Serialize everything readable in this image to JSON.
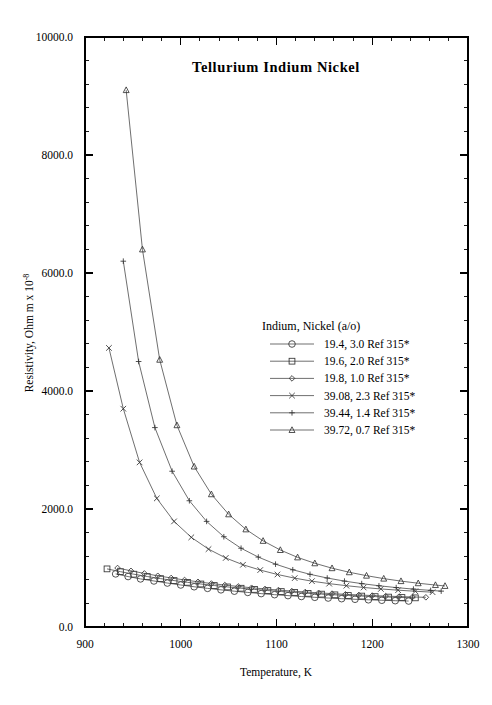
{
  "chart_data": {
    "type": "line",
    "title": "Tellurium  Indium  Nickel",
    "xlabel": "Temperature,  K",
    "ylabel": "Resistivity, Ohm m x 10",
    "ylabel_exponent": "-8",
    "xlim": [
      900,
      1300
    ],
    "ylim": [
      0,
      10000
    ],
    "xticks": [
      900,
      1000,
      1100,
      1200,
      1300
    ],
    "xtick_labels": [
      "900",
      "1000",
      "1100",
      "1200",
      "1300"
    ],
    "yticks": [
      0,
      2000,
      4000,
      6000,
      8000,
      10000
    ],
    "ytick_labels": [
      "0.0",
      "2000.0",
      "4000.0",
      "6000.0",
      "8000.0",
      "10000.0"
    ],
    "x_minor_per_major": 5,
    "y_minor_per_major": 5,
    "grid": false,
    "legend_position": "center-right",
    "legend_title": "Indium, Nickel (a/o)",
    "series": [
      {
        "name": "19.4, 3.0 Ref 315*",
        "marker": "circle",
        "color": "#555555",
        "x": [
          932,
          945,
          958,
          972,
          986,
          1000,
          1014,
          1028,
          1042,
          1056,
          1070,
          1084,
          1098,
          1112,
          1126,
          1140,
          1154,
          1168,
          1182,
          1196,
          1210,
          1224,
          1238
        ],
        "y": [
          900,
          855,
          815,
          780,
          745,
          712,
          682,
          655,
          630,
          607,
          586,
          566,
          548,
          532,
          517,
          503,
          491,
          480,
          470,
          461,
          453,
          446,
          440
        ]
      },
      {
        "name": "19.6, 2.0 Ref 315*",
        "marker": "square",
        "color": "#555555",
        "x": [
          923,
          937,
          951,
          965,
          979,
          993,
          1007,
          1021,
          1035,
          1049,
          1063,
          1077,
          1091,
          1105,
          1119,
          1133,
          1147,
          1161,
          1175,
          1189,
          1203,
          1217,
          1231,
          1245
        ],
        "y": [
          985,
          938,
          895,
          856,
          820,
          787,
          757,
          729,
          703,
          679,
          657,
          637,
          618,
          601,
          585,
          570,
          557,
          545,
          534,
          524,
          515,
          507,
          500,
          494
        ]
      },
      {
        "name": "19.8, 1.0 Ref 315*",
        "marker": "diamond",
        "color": "#555555",
        "x": [
          934,
          948,
          962,
          976,
          990,
          1004,
          1018,
          1032,
          1046,
          1060,
          1074,
          1088,
          1102,
          1116,
          1130,
          1144,
          1158,
          1172,
          1186,
          1200,
          1214,
          1228,
          1242,
          1256
        ],
        "y": [
          1000,
          952,
          908,
          868,
          831,
          797,
          766,
          737,
          711,
          687,
          665,
          645,
          626,
          609,
          593,
          579,
          566,
          554,
          543,
          533,
          524,
          516,
          509,
          503
        ]
      },
      {
        "name": "39.08, 2.3 Ref 315*",
        "marker": "cross-x",
        "color": "#555555",
        "x": [
          925,
          940,
          957,
          975,
          993,
          1011,
          1029,
          1047,
          1065,
          1083,
          1101,
          1119,
          1137,
          1155,
          1173,
          1191,
          1209,
          1227,
          1245,
          1263
        ],
        "y": [
          4730,
          3700,
          2790,
          2180,
          1790,
          1520,
          1320,
          1170,
          1055,
          965,
          890,
          828,
          777,
          735,
          700,
          670,
          645,
          624,
          606,
          590
        ]
      },
      {
        "name": "39.44, 1.4 Ref 315*",
        "marker": "plus",
        "color": "#555555",
        "x": [
          940,
          956,
          973,
          991,
          1009,
          1027,
          1045,
          1063,
          1081,
          1099,
          1117,
          1135,
          1153,
          1171,
          1189,
          1207,
          1225,
          1243,
          1261,
          1272
        ],
        "y": [
          6200,
          4500,
          3380,
          2640,
          2140,
          1790,
          1530,
          1335,
          1185,
          1065,
          970,
          893,
          830,
          778,
          735,
          699,
          668,
          642,
          620,
          608
        ]
      },
      {
        "name": "39.72, 0.7 Ref 315*",
        "marker": "triangle",
        "color": "#555555",
        "x": [
          943,
          960,
          978,
          996,
          1014,
          1032,
          1050,
          1068,
          1086,
          1104,
          1122,
          1140,
          1158,
          1176,
          1194,
          1212,
          1230,
          1248,
          1266,
          1276
        ],
        "y": [
          9100,
          6400,
          4530,
          3420,
          2720,
          2250,
          1910,
          1655,
          1460,
          1305,
          1180,
          1080,
          997,
          928,
          870,
          820,
          778,
          742,
          711,
          696
        ]
      }
    ]
  }
}
